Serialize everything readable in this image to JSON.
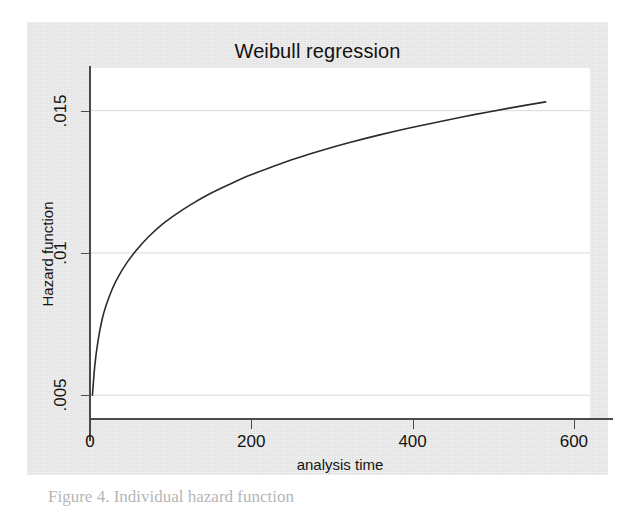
{
  "figure": {
    "title": "Weibull regression",
    "caption": "Figure 4. Individual hazard function",
    "background_color": "#e8e8e8",
    "plot_background_color": "#ffffff",
    "line_color": "#2b2b2b",
    "grid_color": "#d9d9d9",
    "axis_color": "#4a4a4a"
  },
  "chart_data": {
    "type": "line",
    "title": "Weibull regression",
    "xlabel": "analysis time",
    "ylabel": "Hazard function",
    "xlim": [
      0,
      620
    ],
    "ylim": [
      0.0042,
      0.0165
    ],
    "grid": true,
    "grid_axis": "y",
    "legend": "none",
    "xticks": [
      0,
      200,
      400,
      600
    ],
    "xticklabels": [
      "0",
      "200",
      "400",
      "600"
    ],
    "yticks": [
      0.005,
      0.01,
      0.015
    ],
    "yticklabels": [
      ".005",
      ".01",
      ".015"
    ],
    "series": [
      {
        "name": "Hazard function",
        "x": [
          3,
          6,
          10,
          15,
          20,
          28,
          36,
          46,
          58,
          72,
          88,
          105,
          125,
          148,
          172,
          198,
          226,
          256,
          288,
          322,
          358,
          396,
          436,
          478,
          520,
          565
        ],
        "y": [
          0.005,
          0.00606,
          0.00692,
          0.00766,
          0.00816,
          0.00876,
          0.00921,
          0.00967,
          0.01011,
          0.01055,
          0.01097,
          0.01133,
          0.0117,
          0.01207,
          0.0124,
          0.01273,
          0.01303,
          0.01333,
          0.01361,
          0.01388,
          0.01414,
          0.01439,
          0.01463,
          0.01487,
          0.01509,
          0.01531
        ]
      }
    ]
  }
}
